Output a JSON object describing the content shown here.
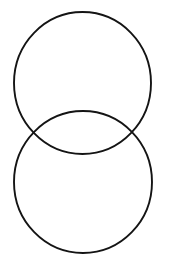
{
  "canvas": {
    "width": 170,
    "height": 275,
    "background_color": "#ffffff",
    "title": "Two overlapping circles"
  },
  "chart_data": {
    "type": "diagram",
    "subtype": "venn-two-circle-vertical",
    "title": "",
    "xlabel": "",
    "ylabel": "",
    "grid": false,
    "legend": "none",
    "axis_ranges": {
      "x": [
        0,
        170
      ],
      "y": [
        0,
        275
      ]
    },
    "shapes": [
      {
        "id": "upper-circle",
        "label": "",
        "kind": "ellipse",
        "cx": 82.5,
        "cy": 83,
        "rx": 68.5,
        "ry": 71,
        "stroke_color": "#141414",
        "stroke_width": 1.9,
        "fill": "none"
      },
      {
        "id": "lower-circle",
        "label": "",
        "kind": "ellipse",
        "cx": 83,
        "cy": 182,
        "rx": 69,
        "ry": 71,
        "stroke_color": "#141414",
        "stroke_width": 1.9,
        "fill": "none"
      }
    ],
    "intersection_points": [
      {
        "id": "left-intersection",
        "x": 33,
        "y": 132
      },
      {
        "id": "right-intersection",
        "x": 138,
        "y": 132
      }
    ],
    "annotations": []
  },
  "style": {
    "stroke_color": "#141414",
    "stroke_width": 1.9,
    "fill": "none",
    "background_color": "#ffffff"
  }
}
